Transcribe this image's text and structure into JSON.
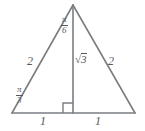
{
  "figure": {
    "kind": "geometry-diagram",
    "stroke_color": "#7a7d82",
    "label_color": "#55585c",
    "background_color": "#ffffff",
    "vertices": {
      "apex": {
        "x": 73,
        "y": 5
      },
      "bottom_left": {
        "x": 12,
        "y": 113
      },
      "bottom_right": {
        "x": 135,
        "y": 113
      },
      "altitude_foot": {
        "x": 73,
        "y": 113
      }
    },
    "labels": {
      "apex_angle_numerator": "π",
      "apex_angle_denominator": "6",
      "base_left_angle_numerator": "π",
      "base_left_angle_denominator": "3",
      "altitude_radical_sign": "√",
      "altitude_radical_argument": "3",
      "left_side": "2",
      "right_side": "2",
      "base_left_segment": "1",
      "base_right_segment": "1"
    }
  }
}
